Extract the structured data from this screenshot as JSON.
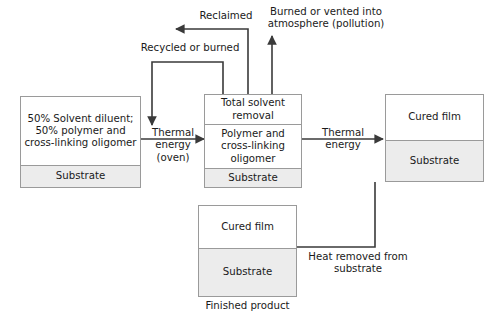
{
  "diagram": {
    "colors": {
      "line": "#3a3a3a",
      "box_border": "#9a9a9a",
      "substrate_fill": "#ececec",
      "background": "#ffffff",
      "text": "#1a1a1a"
    },
    "nodes": [
      {
        "id": "wet-coating",
        "name": "wet-coating-node",
        "layers": [
          {
            "id": "wet-coating-composition",
            "text": "50% Solvent\ndiluent;\n50% polymer and\ncross-linking\noligomer",
            "shaded": false
          },
          {
            "id": "wet-coating-substrate",
            "text": "Substrate",
            "shaded": true
          }
        ]
      },
      {
        "id": "solvent-removal",
        "name": "solvent-removal-node",
        "layers": [
          {
            "id": "solvent-removal-header",
            "text": "Total solvent\nremoval",
            "shaded": false
          },
          {
            "id": "solvent-removal-polymer",
            "text": "Polymer and\ncross-linking\noligomer",
            "shaded": false
          },
          {
            "id": "solvent-removal-substrate",
            "text": "Substrate",
            "shaded": true
          }
        ]
      },
      {
        "id": "cured-film-hot",
        "name": "cured-film-hot-node",
        "layers": [
          {
            "id": "cured-film-hot-film",
            "text": "Cured film",
            "shaded": false
          },
          {
            "id": "cured-film-hot-substrate",
            "text": "Substrate",
            "shaded": true
          }
        ]
      },
      {
        "id": "finished-product",
        "name": "finished-product-node",
        "layers": [
          {
            "id": "finished-product-film",
            "text": "Cured film",
            "shaded": false
          },
          {
            "id": "finished-product-substrate",
            "text": "Substrate",
            "shaded": true
          }
        ]
      }
    ],
    "edge_labels": {
      "reclaimed": "Reclaimed",
      "recycled_or_burned": "Recycled or burned",
      "burned_or_vented": "Burned or vented into\natmosphere (pollution)",
      "thermal_energy_oven": "Thermal\nenergy (oven)",
      "thermal_energy": "Thermal\nenergy",
      "heat_removed": "Heat removed from\nsubstrate"
    },
    "captions": {
      "finished_product": "Finished product"
    }
  }
}
